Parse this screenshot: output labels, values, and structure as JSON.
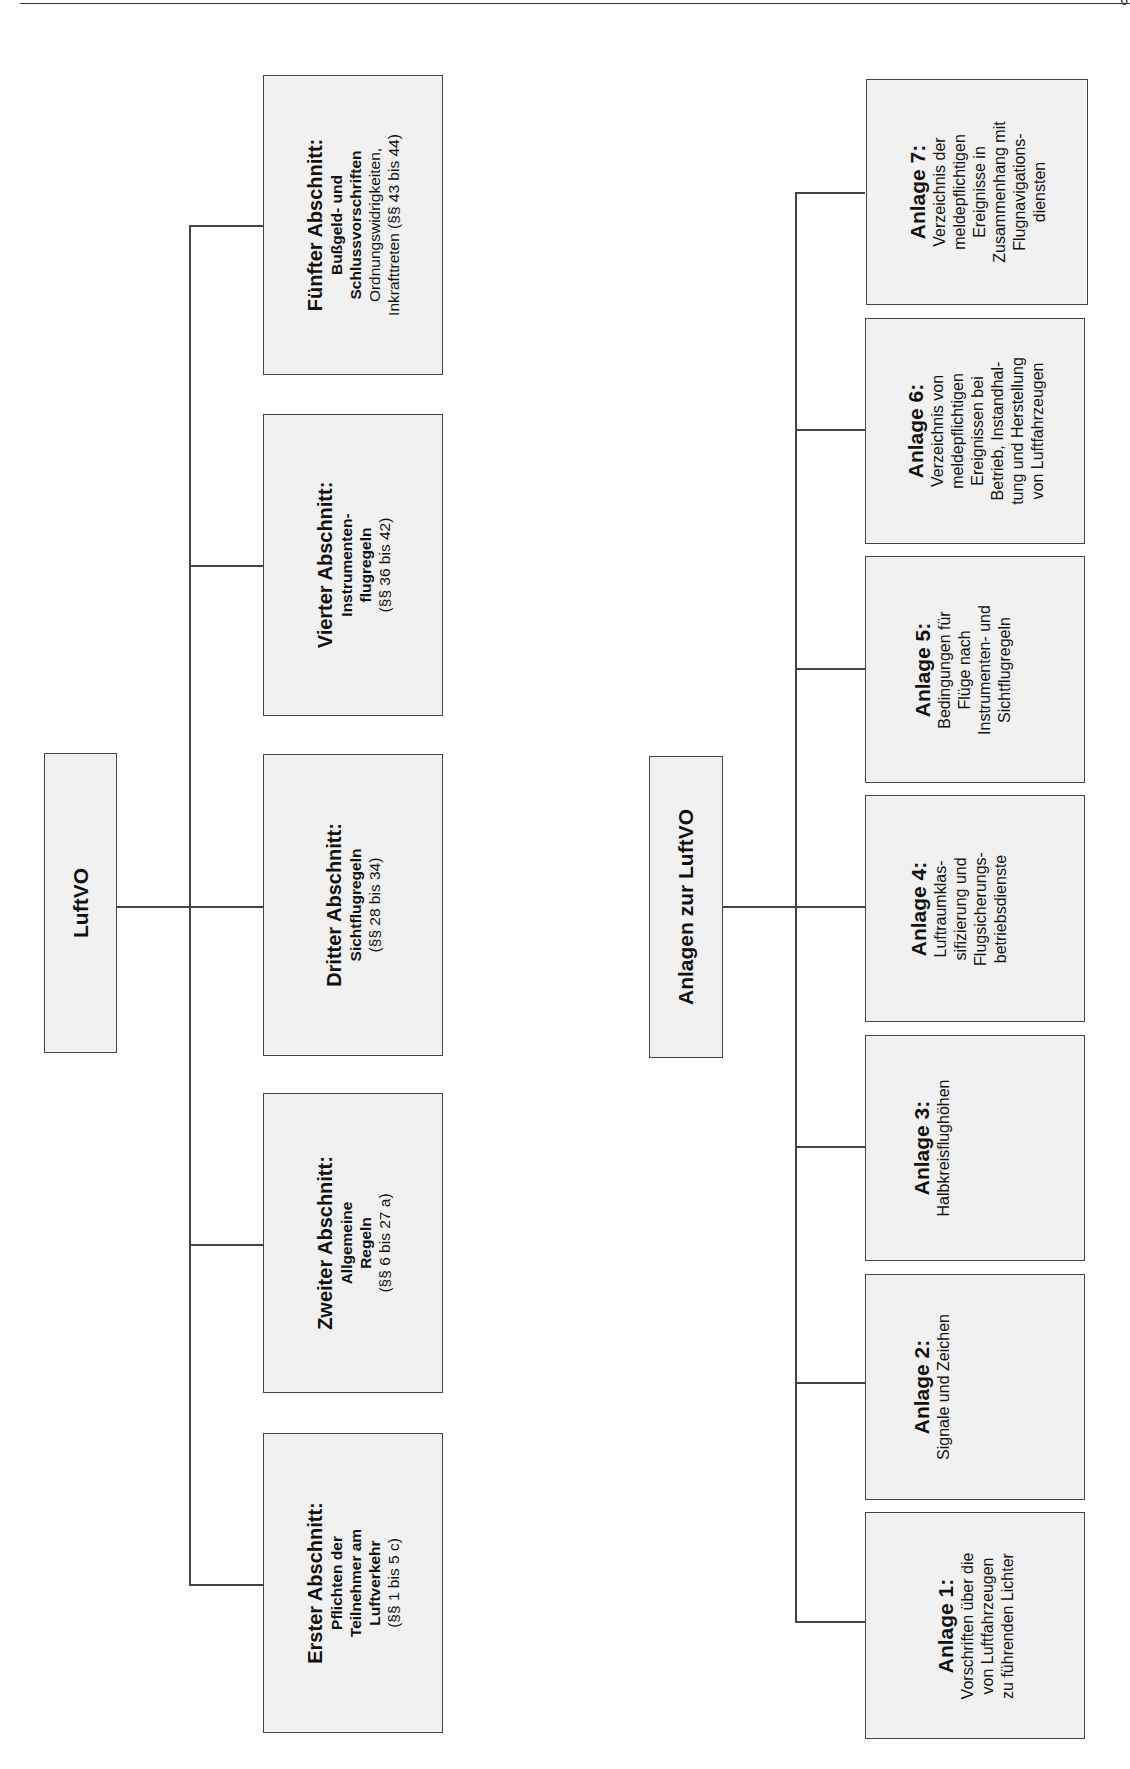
{
  "page": {
    "page_number_fragment": "6"
  },
  "tree1": {
    "root": {
      "label": "LuftVO"
    },
    "children": [
      {
        "title": "Erster Abschnitt:",
        "lines_bold": [
          "Pflichten der",
          "Teilnehmer am",
          "Luftverkehr"
        ],
        "lines": [
          "(§§ 1 bis 5 c)"
        ]
      },
      {
        "title": "Zweiter Abschnitt:",
        "lines_bold": [
          "Allgemeine",
          "Regeln"
        ],
        "lines": [
          "(§§ 6 bis 27 a)"
        ]
      },
      {
        "title": "Dritter Abschnitt:",
        "lines_bold": [
          "Sichtflugregeln"
        ],
        "lines": [
          "(§§ 28 bis 34)"
        ]
      },
      {
        "title": "Vierter Abschnitt:",
        "lines_bold": [
          "Instrumenten-",
          "flugregeln"
        ],
        "lines": [
          "(§§ 36 bis 42)"
        ]
      },
      {
        "title": "Fünfter Abschnitt:",
        "lines_bold": [
          "Bußgeld- und",
          "Schlussvorschriften"
        ],
        "lines": [
          "Ordnungswidrigkeiten,",
          "Inkrafttreten (§§ 43 bis 44)"
        ]
      }
    ]
  },
  "tree2": {
    "root": {
      "label": "Anlagen zur LuftVO"
    },
    "children": [
      {
        "title": "Anlage 1:",
        "lines": [
          "Vorschriften über die",
          "von Luftfahrzeugen",
          "zu führenden Lichter"
        ]
      },
      {
        "title": "Anlage 2:",
        "lines": [
          "Signale und Zeichen"
        ]
      },
      {
        "title": "Anlage 3:",
        "lines": [
          "Halbkreisflughöhen"
        ]
      },
      {
        "title": "Anlage 4:",
        "lines": [
          "Luftraumklas-",
          "sifizierung und",
          "Flugsicherungs-",
          "betriebsdienste"
        ]
      },
      {
        "title": "Anlage 5:",
        "lines": [
          "Bedingungen für",
          "Flüge nach",
          "Instrumenten- und",
          "Sichtflugregeln"
        ]
      },
      {
        "title": "Anlage 6:",
        "lines": [
          "Verzeichnis von",
          "meldepflichtigen",
          "Ereignissen bei",
          "Betrieb, Instandhal-",
          "tung und Herstellung",
          "von Luftfahrzeugen"
        ]
      },
      {
        "title": "Anlage 7:",
        "lines": [
          "Verzeichnis der",
          "meldepflichtigen",
          "Ereignisse in",
          "Zusammenhang mit",
          "Flugnavigations-",
          "diensten"
        ]
      }
    ]
  }
}
